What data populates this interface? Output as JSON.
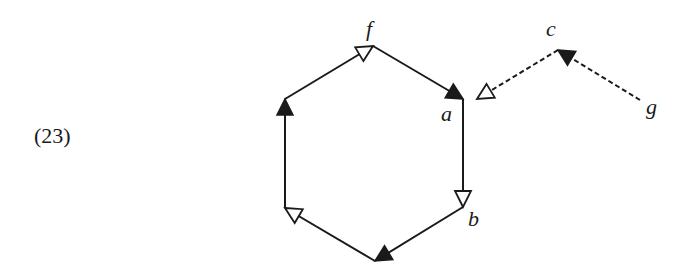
{
  "example_number": "(23)",
  "colors": {
    "ink": "#1a1a1a",
    "background": "#ffffff"
  },
  "nodes": [
    {
      "id": "f",
      "label": "f",
      "x": 373,
      "y": 46,
      "label_x": 366,
      "label_y": 36
    },
    {
      "id": "a",
      "label": "a",
      "x": 463,
      "y": 99,
      "label_x": 441,
      "label_y": 121
    },
    {
      "id": "b",
      "label": "b",
      "x": 463,
      "y": 207,
      "label_x": 468,
      "label_y": 226
    },
    {
      "id": "bottom",
      "label": "",
      "x": 375,
      "y": 261
    },
    {
      "id": "lower_left",
      "label": "",
      "x": 285,
      "y": 208
    },
    {
      "id": "upper_left",
      "label": "",
      "x": 285,
      "y": 99
    },
    {
      "id": "c",
      "label": "c",
      "x": 558,
      "y": 50,
      "label_x": 546,
      "label_y": 36
    },
    {
      "id": "g",
      "label": "g",
      "x": 640,
      "y": 100,
      "label_x": 646,
      "label_y": 114
    }
  ],
  "edges": [
    {
      "from": "upper_left",
      "to": "f",
      "style": "solid",
      "head": "open"
    },
    {
      "from": "f",
      "to": "a",
      "style": "solid",
      "head": "filled"
    },
    {
      "from": "a",
      "to": "b",
      "style": "solid",
      "head": "open"
    },
    {
      "from": "b",
      "to": "bottom",
      "style": "solid",
      "head": "filled"
    },
    {
      "from": "bottom",
      "to": "lower_left",
      "style": "solid",
      "head": "open"
    },
    {
      "from": "lower_left",
      "to": "upper_left",
      "style": "solid",
      "head": "filled"
    },
    {
      "from": "c",
      "to": "a",
      "style": "dashed",
      "head": "open",
      "offset_x": 14
    },
    {
      "from": "g",
      "to": "c",
      "style": "dashed",
      "head": "filled"
    }
  ]
}
